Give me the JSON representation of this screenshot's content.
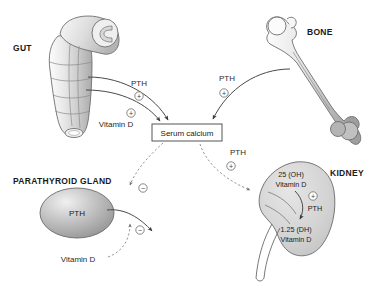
{
  "diagram": {
    "background_color": "#ffffff",
    "organs": {
      "gut": {
        "label": "GUT",
        "name": "gut"
      },
      "bone": {
        "label": "BONE",
        "name": "bone"
      },
      "parathyroid": {
        "label": "PARATHYROID GLAND",
        "name": "parathyroid-gland",
        "hormone": "PTH"
      },
      "kidney": {
        "label": "KIDNEY",
        "name": "kidney",
        "substrate": "25 (OH)\nVitamin D",
        "substrate_line1": "25 (OH)",
        "substrate_line2": "Vitamin D",
        "product_line1": "1.25 (DH)",
        "product_line2": "Vitamin D",
        "enzyme_label": "PTH"
      }
    },
    "center_node": {
      "label": "Serum calcium",
      "name": "serum-calcium-box"
    },
    "flows": [
      {
        "id": "gut-pth",
        "label": "PTH",
        "sign": "+",
        "sign_glyph": "⊕",
        "source": "gut",
        "target": "serum-calcium"
      },
      {
        "id": "gut-vitamin-d",
        "label": "Vitamin D",
        "sign": "+",
        "sign_glyph": "⊕",
        "source": "gut",
        "target": "serum-calcium"
      },
      {
        "id": "bone-pth",
        "label": "PTH",
        "sign": "+",
        "sign_glyph": "⊕",
        "source": "bone",
        "target": "serum-calcium"
      },
      {
        "id": "kidney-pth",
        "label": "PTH",
        "sign": "+",
        "sign_glyph": "⊕",
        "source": "serum-calcium",
        "target": "kidney"
      },
      {
        "id": "calcium-inhibits-pth",
        "label": "",
        "sign": "−",
        "sign_glyph": "⊖",
        "source": "serum-calcium",
        "target": "parathyroid-gland"
      },
      {
        "id": "vitamin-d-inhibits-pth",
        "label": "Vitamin D",
        "sign": "−",
        "sign_glyph": "⊖",
        "source": "vitamin-d",
        "target": "parathyroid-gland"
      }
    ],
    "colors": {
      "organ_stroke": "#6e6e6e",
      "solid_arrow": "#4a4a4a",
      "dashed_arrow": "#8a8a8a",
      "text": "#1a1a1a",
      "box_stroke": "#555555"
    }
  }
}
